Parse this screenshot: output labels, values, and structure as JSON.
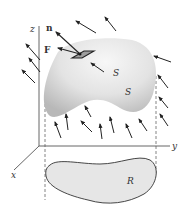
{
  "figure": {
    "labels": {
      "z_axis": "z",
      "y_axis": "y",
      "x_axis": "x",
      "normal_vector": "n",
      "field_vector": "F",
      "surface_top": "S",
      "surface_middle": "S",
      "region": "R"
    },
    "colors": {
      "surface_fill_light": "#f2f2f2",
      "surface_fill_dark": "#bdbdbd",
      "region_fill": "#e6e6e6",
      "line": "#333333",
      "axis": "#555555",
      "dashed": "#666666"
    },
    "field_arrows": [
      {
        "x1": 96,
        "y1": 33,
        "x2": 76,
        "y2": 21
      },
      {
        "x1": 116,
        "y1": 31,
        "x2": 105,
        "y2": 17
      },
      {
        "x1": 40,
        "y1": 60,
        "x2": 26,
        "y2": 44
      },
      {
        "x1": 40,
        "y1": 72,
        "x2": 29,
        "y2": 58
      },
      {
        "x1": 35,
        "y1": 83,
        "x2": 22,
        "y2": 70
      },
      {
        "x1": 104,
        "y1": 72,
        "x2": 91,
        "y2": 63
      },
      {
        "x1": 171,
        "y1": 62,
        "x2": 154,
        "y2": 56
      },
      {
        "x1": 168,
        "y1": 88,
        "x2": 158,
        "y2": 75
      },
      {
        "x1": 168,
        "y1": 108,
        "x2": 159,
        "y2": 97
      },
      {
        "x1": 168,
        "y1": 126,
        "x2": 160,
        "y2": 114
      },
      {
        "x1": 61,
        "y1": 138,
        "x2": 55,
        "y2": 122
      },
      {
        "x1": 68,
        "y1": 130,
        "x2": 66,
        "y2": 114
      },
      {
        "x1": 92,
        "y1": 132,
        "x2": 81,
        "y2": 121
      },
      {
        "x1": 91,
        "y1": 117,
        "x2": 85,
        "y2": 106
      },
      {
        "x1": 102,
        "y1": 139,
        "x2": 100,
        "y2": 124
      },
      {
        "x1": 114,
        "y1": 133,
        "x2": 110,
        "y2": 117
      },
      {
        "x1": 132,
        "y1": 138,
        "x2": 126,
        "y2": 124
      },
      {
        "x1": 147,
        "y1": 131,
        "x2": 139,
        "y2": 119
      }
    ]
  }
}
